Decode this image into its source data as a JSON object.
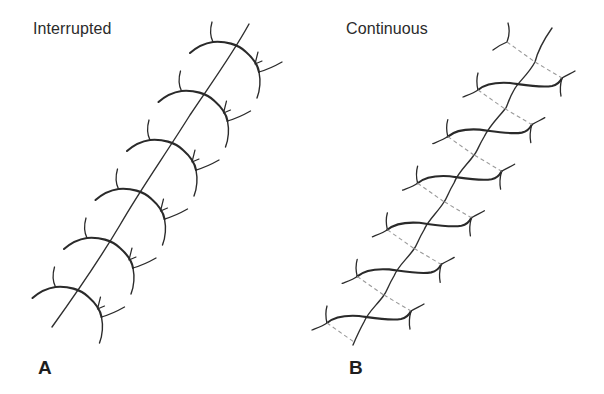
{
  "figure": {
    "panels": [
      {
        "id": "A",
        "title": "Interrupted",
        "letter": "A",
        "stitch_count": 6,
        "description": "Individual looped stitches, each tied separately, crossing a diagonal incision"
      },
      {
        "id": "B",
        "title": "Continuous",
        "letter": "B",
        "stitch_count": 6,
        "description": "Single running thread crossing the diagonal incision; dashed lines show thread path beneath tissue"
      }
    ],
    "colors": {
      "thread": "#2a2a2a",
      "incision": "#2f2f2f",
      "hidden_thread": "#9a9a9a",
      "background": "#ffffff"
    }
  }
}
